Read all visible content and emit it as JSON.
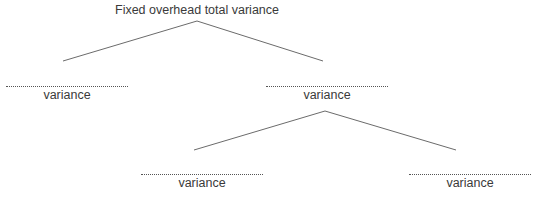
{
  "diagram": {
    "title": "Fixed overhead total variance",
    "nodes": [
      {
        "id": "left-level1",
        "blank": "",
        "label": "variance"
      },
      {
        "id": "right-level1",
        "blank": "",
        "label": "variance"
      },
      {
        "id": "left-level2",
        "blank": "",
        "label": "variance"
      },
      {
        "id": "right-level2",
        "blank": "",
        "label": "variance"
      }
    ],
    "line_color": "#6b6b6b"
  }
}
